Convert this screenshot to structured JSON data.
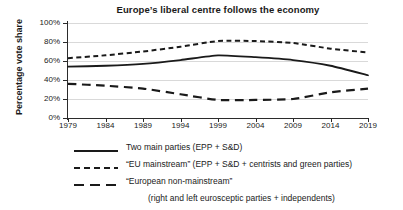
{
  "chart_data": {
    "type": "line",
    "title": "Europe’s liberal centre follows the economy",
    "xlabel": "",
    "ylabel": "Percentage vote share",
    "x": [
      1979,
      1984,
      1989,
      1994,
      1999,
      2004,
      2009,
      2014,
      2019
    ],
    "xtick_labels": [
      "1979",
      "1984",
      "1989",
      "1994",
      "1999",
      "2004",
      "2009",
      "2014",
      "2019"
    ],
    "ytick_labels": [
      "0%",
      "20%",
      "40%",
      "60%",
      "80%",
      "100%"
    ],
    "ytick_values": [
      0,
      20,
      40,
      60,
      80,
      100
    ],
    "ylim": [
      0,
      100
    ],
    "xlim": [
      1979,
      2019
    ],
    "grid": true,
    "legend_position": "below",
    "series": [
      {
        "name": "Two main parties (EPP + S&D)",
        "style": "solid",
        "color": "#1a1a1a",
        "values": [
          54,
          55,
          57,
          61,
          66,
          64,
          61,
          55,
          45
        ]
      },
      {
        "name": "“EU mainstream” (EPP + S&D + centrists and green parties)",
        "style": "short-dash",
        "color": "#1a1a1a",
        "values": [
          63,
          66,
          70,
          75,
          81,
          81,
          79,
          73,
          69
        ]
      },
      {
        "name": "“European non-mainstream” (right and left eurosceptic parties + independents)",
        "style": "long-dash",
        "color": "#1a1a1a",
        "values": [
          36,
          34,
          31,
          25,
          19,
          19,
          20,
          27,
          31
        ]
      }
    ]
  },
  "legend": {
    "items": [
      {
        "swatch": "solid-line-swatch",
        "label": "Two main parties (EPP + S&D)",
        "sublabel": ""
      },
      {
        "swatch": "short-dash-line-swatch",
        "label": "“EU mainstream” (EPP + S&D + centrists and green parties)",
        "sublabel": ""
      },
      {
        "swatch": "long-dash-line-swatch",
        "label": "“European non-mainstream”",
        "sublabel": "(right and left eurosceptic parties + independents)"
      }
    ]
  },
  "colors": {
    "line": "#1a1a1a",
    "grid": "#d9d9d9",
    "axis": "#2b2b2b",
    "background": "#ffffff"
  }
}
